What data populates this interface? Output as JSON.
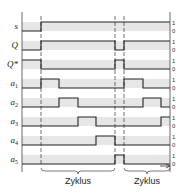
{
  "diagram": {
    "type": "timing-diagram",
    "colors": {
      "band": "#e6e6e6",
      "line": "#222222",
      "axis": "#444444"
    },
    "time_marks": [
      41,
      59,
      78,
      96,
      115,
      124,
      143,
      161
    ],
    "dashed_marks": [
      41,
      115,
      124
    ],
    "signals": [
      {
        "name": "s",
        "label": "s",
        "sub": "",
        "high_y": 22,
        "low_y": 31,
        "wave": [
          [
            22,
            "0"
          ],
          [
            41,
            "1"
          ],
          [
            170,
            "1"
          ]
        ]
      },
      {
        "name": "Q",
        "label": "Q",
        "sub": "",
        "high_y": 41,
        "low_y": 50,
        "wave": [
          [
            22,
            "0"
          ],
          [
            41,
            "1"
          ],
          [
            115,
            "0"
          ],
          [
            124,
            "1"
          ],
          [
            170,
            "1"
          ]
        ]
      },
      {
        "name": "Q*",
        "label": "Q*",
        "sub": "",
        "high_y": 60,
        "low_y": 69,
        "wave": [
          [
            22,
            "1"
          ],
          [
            41,
            "0"
          ],
          [
            115,
            "1"
          ],
          [
            124,
            "0"
          ],
          [
            170,
            "0"
          ]
        ]
      },
      {
        "name": "a1",
        "label": "a",
        "sub": "1",
        "high_y": 79,
        "low_y": 88,
        "wave": [
          [
            22,
            "0"
          ],
          [
            41,
            "1"
          ],
          [
            59,
            "0"
          ],
          [
            124,
            "1"
          ],
          [
            143,
            "0"
          ],
          [
            170,
            "0"
          ]
        ]
      },
      {
        "name": "a2",
        "label": "a",
        "sub": "2",
        "high_y": 98,
        "low_y": 107,
        "wave": [
          [
            22,
            "0"
          ],
          [
            59,
            "1"
          ],
          [
            78,
            "0"
          ],
          [
            143,
            "1"
          ],
          [
            161,
            "0"
          ],
          [
            170,
            "0"
          ]
        ]
      },
      {
        "name": "a3",
        "label": "a",
        "sub": "3",
        "high_y": 117,
        "low_y": 126,
        "wave": [
          [
            22,
            "0"
          ],
          [
            78,
            "1"
          ],
          [
            96,
            "0"
          ],
          [
            161,
            "1"
          ],
          [
            170,
            "1"
          ]
        ]
      },
      {
        "name": "a4",
        "label": "a",
        "sub": "4",
        "high_y": 136,
        "low_y": 145,
        "wave": [
          [
            22,
            "0"
          ],
          [
            96,
            "1"
          ],
          [
            115,
            "0"
          ],
          [
            170,
            "0"
          ]
        ]
      },
      {
        "name": "a5",
        "label": "a",
        "sub": "5",
        "high_y": 155,
        "low_y": 164,
        "wave": [
          [
            22,
            "0"
          ],
          [
            115,
            "1"
          ],
          [
            124,
            "0"
          ],
          [
            170,
            "0"
          ]
        ]
      }
    ],
    "level_labels": {
      "high": "1",
      "low": "0"
    },
    "cycles": [
      {
        "label": "Zyklus",
        "from": 41,
        "to": 115
      },
      {
        "label": "Zyklus",
        "from": 124,
        "to": 170
      }
    ]
  }
}
